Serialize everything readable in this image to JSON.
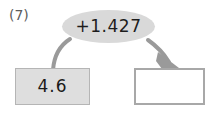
{
  "item": {
    "label": "(7)"
  },
  "diagram": {
    "type": "function-machine",
    "operator": {
      "text": "+1.427"
    },
    "input": {
      "value": "4.6"
    },
    "output": {
      "value": ""
    },
    "colors": {
      "node_fill": "#d9d9d9",
      "input_fill": "#dedede",
      "input_border": "#b5b5b5",
      "output_fill": "#ffffff",
      "output_border": "#a8a8a8",
      "connector": "#9a9a9a",
      "text": "#1a1a1a",
      "label_text": "#5c5c5c",
      "background": "#ffffff"
    }
  }
}
